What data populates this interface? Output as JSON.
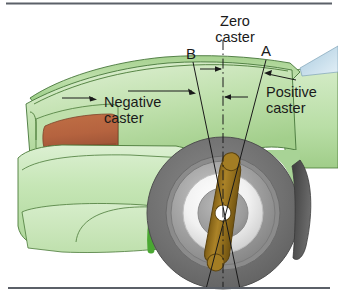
{
  "figure": {
    "width": 338,
    "height": 306
  },
  "labels": {
    "zero_caster": "Zero\ncaster",
    "negative_caster": "Negative\ncaster",
    "positive_caster": "Positive\ncaster",
    "line_b": "B",
    "line_a": "A"
  },
  "colors": {
    "body_green_light": "#cfe7c0",
    "body_green_mid": "#a8d396",
    "body_green_dark": "#7cb863",
    "fender_arch_green": "#4aa832",
    "headlight_orange": "#b5633f",
    "windshield_blue": "#cfe2ee",
    "tire_gray": "#6e6e6e",
    "rim_silver": "#d9d9d9",
    "shock_brown": "#9a7520",
    "line_black": "#1a1a1a",
    "border_gray": "#5b6068",
    "ground_line": "#5b6068"
  },
  "geometry": {
    "zero_caster_axis": "vertical dash-dot line through wheel center",
    "line_b_angle_label": "B (negative caster, tilted forward)",
    "line_a_angle_label": "A (positive caster, tilted rearward)",
    "wheel_center": {
      "x": 223,
      "y": 213
    },
    "ground_y": 288
  },
  "icons": {
    "arrow_zero_left": "arrow-right-icon",
    "arrow_zero_right": "arrow-left-icon",
    "leader_negative": "leader-line-arrow-icon",
    "leader_positive": "leader-line-arrow-icon"
  }
}
